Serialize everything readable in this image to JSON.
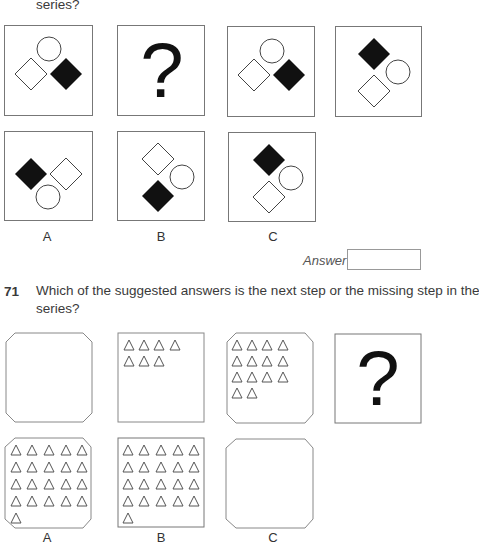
{
  "q70": {
    "prompt_tail": "series?",
    "answer_label": "Answer",
    "answer_value": "",
    "series": [
      {
        "id": "s1",
        "shapes": "circle-top, white-diamond-left, black-diamond-right"
      },
      {
        "id": "s2",
        "shapes": "question-mark"
      },
      {
        "id": "s3",
        "shapes": "circle-top, white-diamond-left, black-diamond-right"
      },
      {
        "id": "s4",
        "shapes": "black-diamond-top, circle-right, white-diamond-bottom"
      }
    ],
    "options": [
      {
        "label": "A"
      },
      {
        "label": "B"
      },
      {
        "label": "C"
      }
    ]
  },
  "q71": {
    "number": "71",
    "prompt_line1": "Which of the suggested answers is the next step or the missing step in the",
    "prompt_line2": "series?",
    "series": [
      {
        "id": "s1",
        "shape": "octagon",
        "triangles": 0
      },
      {
        "id": "s2",
        "shape": "square",
        "triangles": 7
      },
      {
        "id": "s3",
        "shape": "octagon",
        "triangles": 14
      },
      {
        "id": "s4",
        "shape": "question-mark"
      }
    ],
    "options": [
      {
        "label": "A",
        "shape": "octagon",
        "triangles": 21
      },
      {
        "label": "B",
        "shape": "square",
        "triangles": 21
      },
      {
        "label": "C",
        "shape": "octagon",
        "triangles": 0
      }
    ]
  },
  "question_mark": "?"
}
